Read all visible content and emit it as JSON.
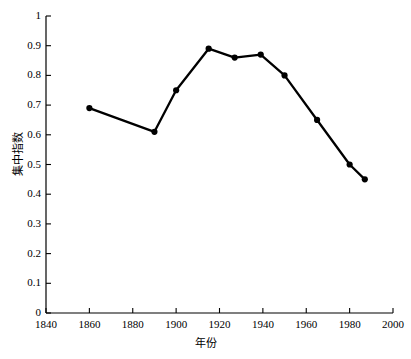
{
  "chart_data": {
    "type": "line",
    "title": "",
    "subtitle": "",
    "xlabel": "年份",
    "ylabel": "集中指数",
    "xlim": [
      1840,
      2000
    ],
    "ylim": [
      0,
      1
    ],
    "grid": false,
    "legend": null,
    "x_ticks": [
      "1840",
      "1860",
      "1880",
      "1900",
      "1920",
      "1940",
      "1960",
      "1980",
      "2000"
    ],
    "x_tick_values": [
      1840,
      1860,
      1880,
      1900,
      1920,
      1940,
      1960,
      1980,
      2000
    ],
    "y_ticks": [
      "0",
      "0.1",
      "0.2",
      "0.3",
      "0.4",
      "0.5",
      "0.6",
      "0.7",
      "0.8",
      "0.9",
      "1"
    ],
    "y_tick_values": [
      0,
      0.1,
      0.2,
      0.3,
      0.4,
      0.5,
      0.6,
      0.7,
      0.8,
      0.9,
      1
    ],
    "series": [
      {
        "name": "集中指数",
        "color": "#000000",
        "marker": "circle",
        "x": [
          1860,
          1890,
          1900,
          1915,
          1927,
          1939,
          1950,
          1965,
          1980,
          1987
        ],
        "values": [
          0.69,
          0.61,
          0.75,
          0.89,
          0.86,
          0.87,
          0.8,
          0.65,
          0.5,
          0.45
        ]
      }
    ],
    "annotations": []
  },
  "axes": {
    "y_axis_name": "y-axis",
    "x_axis_name": "x-axis"
  }
}
